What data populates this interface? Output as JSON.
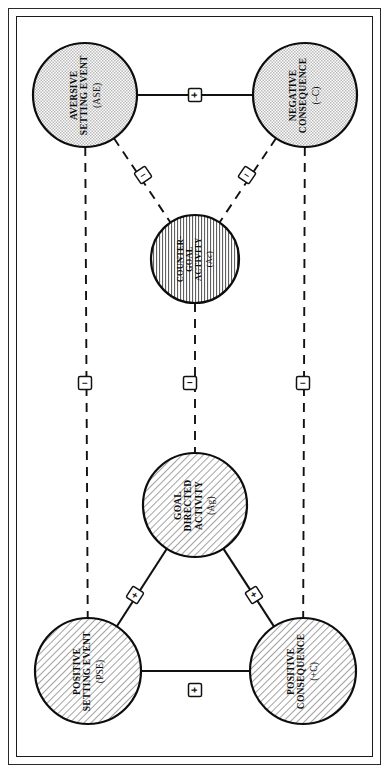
{
  "figure": {
    "orientation": "rotated-90-ccw",
    "frame": {
      "outer": true,
      "inner": true,
      "border_color": "#1a1a1a"
    },
    "background": "#ffffff"
  },
  "nodes": [
    {
      "id": "ase",
      "line1": "AVERSIVE",
      "line2": "SETTING EVENT",
      "abbr": "(ASE)",
      "fill": "dotted",
      "fill_color": "#d8d8d8",
      "cx": 85,
      "cy": 95,
      "r": 52
    },
    {
      "id": "nc",
      "line1": "NEGATIVE",
      "line2": "CONSEQUENCE",
      "abbr": "(–C)",
      "fill": "dotted",
      "fill_color": "#d8d8d8",
      "cx": 305,
      "cy": 95,
      "r": 52
    },
    {
      "id": "cga",
      "line1": "COUNTER-",
      "line2": "GOAL",
      "line3": "ACTIVITY",
      "abbr": "(Ac)",
      "fill": "vertical-hatch",
      "fill_color": "#ffffff",
      "cx": 195,
      "cy": 259,
      "r": 44
    },
    {
      "id": "gda",
      "line1": "GOAL",
      "line2": "DIRECTED",
      "line3": "ACTIVITY",
      "abbr": "(Ag)",
      "fill": "diagonal-hatch",
      "fill_color": "#dcdcdc",
      "cx": 195,
      "cy": 505,
      "r": 52
    },
    {
      "id": "pse",
      "line1": "POSITIVE",
      "line2": "SETTING EVENT",
      "abbr": "(PSE)",
      "fill": "diagonal-hatch",
      "fill_color": "#dcdcdc",
      "cx": 88,
      "cy": 671,
      "r": 53
    },
    {
      "id": "pc",
      "line1": "POSITIVE",
      "line2": "CONSEQUENCE",
      "abbr": "(+C)",
      "fill": "diagonal-hatch",
      "fill_color": "#dcdcdc",
      "cx": 303,
      "cy": 671,
      "r": 53
    }
  ],
  "edges": [
    {
      "id": "ase-nc",
      "from": "ase",
      "to": "nc",
      "style": "solid",
      "sign": "+",
      "label_x": 195,
      "label_y": 95
    },
    {
      "id": "ase-cga",
      "from": "ase",
      "to": "cga",
      "style": "dashed",
      "sign": "–",
      "label_x": 143,
      "label_y": 175
    },
    {
      "id": "nc-cga",
      "from": "nc",
      "to": "cga",
      "style": "dashed",
      "sign": "–",
      "label_x": 247,
      "label_y": 175
    },
    {
      "id": "ase-pse",
      "from": "ase",
      "to": "pse",
      "style": "dashed",
      "sign": "–",
      "label_x": 85,
      "label_y": 383
    },
    {
      "id": "cga-gda",
      "from": "cga",
      "to": "gda",
      "style": "dashed",
      "sign": "–",
      "label_x": 190,
      "label_y": 383
    },
    {
      "id": "nc-pc",
      "from": "nc",
      "to": "pc",
      "style": "dashed",
      "sign": "–",
      "label_x": 303,
      "label_y": 383
    },
    {
      "id": "pse-gda",
      "from": "pse",
      "to": "gda",
      "style": "solid",
      "sign": "+",
      "label_x": 135,
      "label_y": 595
    },
    {
      "id": "gda-pc",
      "from": "gda",
      "to": "pc",
      "style": "solid",
      "sign": "+",
      "label_x": 254,
      "label_y": 595
    },
    {
      "id": "pse-pc",
      "from": "pse",
      "to": "pc",
      "style": "solid",
      "sign": "+",
      "label_x": 195,
      "label_y": 690
    }
  ],
  "legend": {
    "positive_sign": "+",
    "negative_sign": "–"
  }
}
